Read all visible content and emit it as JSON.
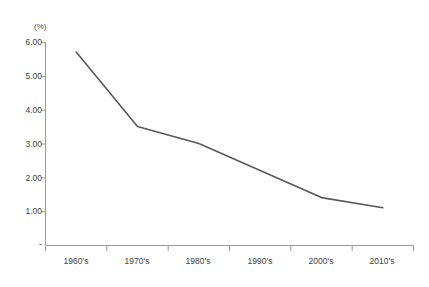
{
  "chart_data": {
    "type": "line",
    "title": "",
    "xlabel": "",
    "ylabel": "",
    "unit_label": "(%)",
    "categories": [
      "1960's",
      "1970's",
      "1980's",
      "1990's",
      "2000's",
      "2010's"
    ],
    "series": [
      {
        "name": "rate",
        "values": [
          5.7,
          3.5,
          3.0,
          2.2,
          1.4,
          1.1
        ]
      }
    ],
    "ylim": [
      0,
      6
    ],
    "ytick_labels": [
      "6.00",
      "5.00",
      "4.00",
      "3.00",
      "2.00",
      "1.00",
      "-"
    ],
    "ytick_values": [
      6,
      5,
      4,
      3,
      2,
      1,
      0
    ],
    "grid": false,
    "legend": "none",
    "line_color": "#595959",
    "axis_color": "#9a9a9a",
    "background": "#ffffff"
  },
  "axis": {
    "y": {
      "t6": "6.00",
      "t5": "5.00",
      "t4": "4.00",
      "t3": "3.00",
      "t2": "2.00",
      "t1": "1.00",
      "t0": "-"
    },
    "x": {
      "c0": "1960's",
      "c1": "1970's",
      "c2": "1980's",
      "c3": "1990's",
      "c4": "2000's",
      "c5": "2010's"
    },
    "unit": "(%)"
  }
}
